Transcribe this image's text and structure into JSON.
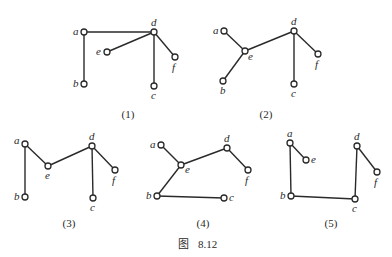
{
  "figure": {
    "caption_prefix": "图",
    "caption_number": "8.12",
    "node_radius": 3,
    "colors": {
      "stroke": "#2a2a2a",
      "background": "#ffffff"
    }
  },
  "graphs": [
    {
      "label": "(1)",
      "label_pos": [
        128,
        118
      ],
      "nodes": [
        {
          "id": "a",
          "x": 84,
          "y": 32,
          "lx": -11,
          "ly": 3
        },
        {
          "id": "d",
          "x": 154,
          "y": 32,
          "lx": -3,
          "ly": -6
        },
        {
          "id": "e",
          "x": 107,
          "y": 52,
          "lx": -11,
          "ly": 3
        },
        {
          "id": "f",
          "x": 175,
          "y": 57,
          "lx": -3,
          "ly": 14
        },
        {
          "id": "b",
          "x": 84,
          "y": 84,
          "lx": -11,
          "ly": 3
        },
        {
          "id": "c",
          "x": 154,
          "y": 86,
          "lx": -3,
          "ly": 13
        }
      ],
      "edges": [
        [
          "a",
          "d"
        ],
        [
          "a",
          "b"
        ],
        [
          "e",
          "d"
        ],
        [
          "d",
          "c"
        ],
        [
          "d",
          "f"
        ]
      ]
    },
    {
      "label": "(2)",
      "label_pos": [
        266,
        118
      ],
      "nodes": [
        {
          "id": "a",
          "x": 224,
          "y": 31,
          "lx": -11,
          "ly": 3
        },
        {
          "id": "d",
          "x": 294,
          "y": 31,
          "lx": -3,
          "ly": -6
        },
        {
          "id": "e",
          "x": 245,
          "y": 51,
          "lx": 3,
          "ly": 9
        },
        {
          "id": "f",
          "x": 318,
          "y": 54,
          "lx": -3,
          "ly": 14
        },
        {
          "id": "b",
          "x": 223,
          "y": 81,
          "lx": -3,
          "ly": 13
        },
        {
          "id": "c",
          "x": 294,
          "y": 84,
          "lx": -3,
          "ly": 13
        }
      ],
      "edges": [
        [
          "a",
          "e"
        ],
        [
          "e",
          "b"
        ],
        [
          "e",
          "d"
        ],
        [
          "d",
          "c"
        ],
        [
          "d",
          "f"
        ]
      ]
    },
    {
      "label": "(3)",
      "label_pos": [
        69,
        227
      ],
      "nodes": [
        {
          "id": "a",
          "x": 25,
          "y": 144,
          "lx": -11,
          "ly": 0
        },
        {
          "id": "e",
          "x": 48,
          "y": 166,
          "lx": -3,
          "ly": 13
        },
        {
          "id": "d",
          "x": 92,
          "y": 146,
          "lx": -3,
          "ly": -6
        },
        {
          "id": "f",
          "x": 115,
          "y": 170,
          "lx": -3,
          "ly": 14
        },
        {
          "id": "b",
          "x": 25,
          "y": 197,
          "lx": -11,
          "ly": 3
        },
        {
          "id": "c",
          "x": 93,
          "y": 198,
          "lx": -3,
          "ly": 13
        }
      ],
      "edges": [
        [
          "a",
          "b"
        ],
        [
          "a",
          "e"
        ],
        [
          "e",
          "d"
        ],
        [
          "d",
          "c"
        ],
        [
          "d",
          "f"
        ]
      ]
    },
    {
      "label": "(4)",
      "label_pos": [
        203,
        227
      ],
      "nodes": [
        {
          "id": "a",
          "x": 161,
          "y": 145,
          "lx": -11,
          "ly": 3
        },
        {
          "id": "e",
          "x": 181,
          "y": 165,
          "lx": 4,
          "ly": 8
        },
        {
          "id": "d",
          "x": 227,
          "y": 148,
          "lx": -3,
          "ly": -6
        },
        {
          "id": "f",
          "x": 248,
          "y": 170,
          "lx": -3,
          "ly": 14
        },
        {
          "id": "b",
          "x": 157,
          "y": 196,
          "lx": -11,
          "ly": 3
        },
        {
          "id": "c",
          "x": 224,
          "y": 198,
          "lx": 5,
          "ly": 3
        }
      ],
      "edges": [
        [
          "a",
          "e"
        ],
        [
          "e",
          "d"
        ],
        [
          "d",
          "f"
        ],
        [
          "e",
          "b"
        ],
        [
          "b",
          "c"
        ]
      ]
    },
    {
      "label": "(5)",
      "label_pos": [
        331,
        227
      ],
      "nodes": [
        {
          "id": "a",
          "x": 290,
          "y": 143,
          "lx": -3,
          "ly": -6
        },
        {
          "id": "e",
          "x": 306,
          "y": 160,
          "lx": 5,
          "ly": 3
        },
        {
          "id": "d",
          "x": 357,
          "y": 146,
          "lx": -3,
          "ly": -6
        },
        {
          "id": "f",
          "x": 377,
          "y": 172,
          "lx": -3,
          "ly": 14
        },
        {
          "id": "b",
          "x": 291,
          "y": 196,
          "lx": -11,
          "ly": 3
        },
        {
          "id": "c",
          "x": 355,
          "y": 199,
          "lx": -3,
          "ly": 13
        }
      ],
      "edges": [
        [
          "a",
          "e"
        ],
        [
          "a",
          "b"
        ],
        [
          "b",
          "c"
        ],
        [
          "c",
          "d"
        ],
        [
          "d",
          "f"
        ]
      ]
    }
  ]
}
